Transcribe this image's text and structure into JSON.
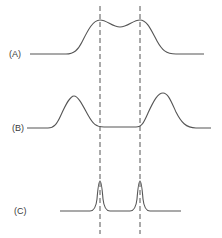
{
  "diagram": {
    "colors": {
      "stroke": "#555555",
      "text": "#3a3a3a",
      "background": "#ffffff"
    },
    "reference_lines": [
      {
        "id": "left",
        "x": 100,
        "style": "dashed"
      },
      {
        "id": "right",
        "x": 140,
        "style": "dashed"
      }
    ],
    "traces": [
      {
        "id": "A",
        "label": "(A)",
        "shape": "two broad overlapping peaks merged with a shallow dip, peaks aligned with dashed lines"
      },
      {
        "id": "B",
        "label": "(B)",
        "shape": "two separated peaks lying outside the dashed lines, flat region between"
      },
      {
        "id": "C",
        "label": "(C)",
        "shape": "two narrow sharp peaks centered on the dashed lines"
      }
    ]
  }
}
